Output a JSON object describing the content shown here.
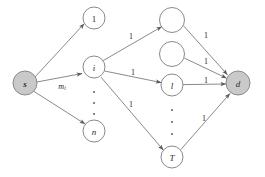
{
  "diagram": {
    "colors": {
      "node_fill": "#ffffff",
      "node_fill_terminal": "#c9c9c9",
      "node_stroke": "#8a8a8a",
      "edge_stroke": "#7d7d7d",
      "text": "#1f1f1f",
      "background": "#ffffff"
    },
    "nodes": [
      {
        "id": "s",
        "label": "s",
        "x": 25,
        "y": 83,
        "r": 12,
        "filled": true,
        "style": "bold-italic"
      },
      {
        "id": "u1",
        "label": "1",
        "x": 94,
        "y": 18,
        "r": 11,
        "filled": false,
        "style": "plain"
      },
      {
        "id": "ui",
        "label": "i",
        "x": 94,
        "y": 67,
        "r": 11,
        "filled": false,
        "style": "italic"
      },
      {
        "id": "un",
        "label": "n",
        "x": 94,
        "y": 131,
        "r": 11,
        "filled": false,
        "style": "italic"
      },
      {
        "id": "v1",
        "label": "",
        "x": 172,
        "y": 20,
        "r": 12.5,
        "filled": false,
        "style": "plain"
      },
      {
        "id": "v2",
        "label": "",
        "x": 172,
        "y": 54,
        "r": 12.5,
        "filled": false,
        "style": "plain"
      },
      {
        "id": "vl",
        "label": "l",
        "x": 172,
        "y": 85,
        "r": 11,
        "filled": false,
        "style": "italic"
      },
      {
        "id": "vT",
        "label": "T",
        "x": 172,
        "y": 157,
        "r": 11,
        "filled": false,
        "style": "italic"
      },
      {
        "id": "d",
        "label": "d",
        "x": 238,
        "y": 83,
        "r": 12,
        "filled": true,
        "style": "bold-italic"
      }
    ],
    "edges": [
      {
        "from": "s",
        "to": "u1",
        "weight": ""
      },
      {
        "from": "s",
        "to": "ui",
        "weight": "m",
        "weight_sub": "i",
        "weight_x": 62,
        "weight_y": 86
      },
      {
        "from": "s",
        "to": "un",
        "weight": ""
      },
      {
        "from": "ui",
        "to": "v1",
        "weight": "1",
        "weight_x": 131,
        "weight_y": 36
      },
      {
        "from": "ui",
        "to": "vl",
        "weight": "1",
        "weight_x": 133,
        "weight_y": 72
      },
      {
        "from": "ui",
        "to": "vT",
        "weight": "1",
        "weight_x": 131,
        "weight_y": 104
      },
      {
        "from": "v1",
        "to": "d",
        "weight": "1",
        "weight_x": 206,
        "weight_y": 35
      },
      {
        "from": "v2",
        "to": "d",
        "weight": "1",
        "weight_x": 206,
        "weight_y": 61
      },
      {
        "from": "vl",
        "to": "d",
        "weight": "1",
        "weight_x": 206,
        "weight_y": 80
      },
      {
        "from": "vT",
        "to": "d",
        "weight": "1",
        "weight_x": 204,
        "weight_y": 118
      }
    ],
    "ellipses": [
      {
        "id": "left-ellipsis",
        "x": 94,
        "dots_y": [
          92,
          103,
          114
        ]
      },
      {
        "id": "right-ellipsis",
        "x": 172,
        "dots_y": [
          110,
          122,
          134
        ]
      }
    ],
    "labels": {
      "node_s": "s",
      "node_1": "1",
      "node_i": "i",
      "node_n": "n",
      "node_l": "l",
      "node_T": "T",
      "node_d": "d",
      "weight_mi_base": "m",
      "weight_mi_sub": "i",
      "weight_unit": "1"
    }
  }
}
